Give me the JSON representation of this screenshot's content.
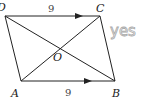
{
  "diagram": {
    "type": "parallelogram",
    "vertices": {
      "A": {
        "label": "A",
        "x": 21,
        "y": 81
      },
      "B": {
        "label": "B",
        "x": 115,
        "y": 81
      },
      "C": {
        "label": "C",
        "x": 100,
        "y": 16
      },
      "D": {
        "label": "D",
        "x": 5,
        "y": 16
      }
    },
    "intersection": {
      "label": "O"
    },
    "side_labels": {
      "DC": "9",
      "AB": "9"
    },
    "annotation": "yes",
    "colors": {
      "lines": "#222222",
      "annotation": "#a8a8a8"
    }
  }
}
